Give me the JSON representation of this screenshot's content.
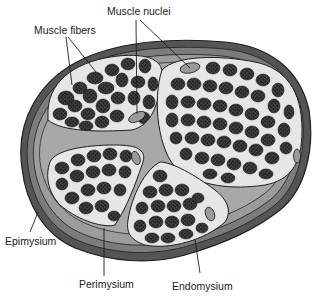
{
  "labels": {
    "muscle_nuclei": "Muscle nuclei",
    "muscle_fibers": "Muscle fibers",
    "epimysium": "Epimysium",
    "perimysium": "Perimysium",
    "endomysium": "Endomysium"
  },
  "colors": {
    "background": "#ffffff",
    "epimysium_outer": "#5e5e5e",
    "epimysium_band": "#8a8a8a",
    "perimysium": "#a6a6a6",
    "endomysium": "#e4e4e4",
    "fiber": "#3a3a3a",
    "fiber_dots": "#151515",
    "nucleus": "#9a9a9a",
    "outline": "#1e1e1e",
    "text": "#1a1a1a"
  },
  "fascicles": [
    {
      "name": "upper-left",
      "nucleus": [
        137,
        117
      ]
    },
    {
      "name": "right",
      "nucleus": [
        190,
        67
      ]
    },
    {
      "name": "lower-left",
      "nucleus": [
        136,
        158
      ]
    },
    {
      "name": "lower-middle",
      "nucleus": [
        210,
        214
      ]
    }
  ]
}
